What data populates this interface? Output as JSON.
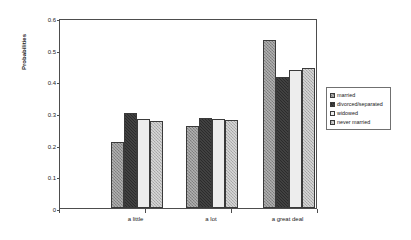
{
  "chart_data": {
    "type": "bar",
    "title": "",
    "subtitle": "",
    "xlabel": "",
    "ylabel": "Probabilities",
    "categories": [
      "a little",
      "a lot",
      "a great deal"
    ],
    "series": [
      {
        "name": "married",
        "values": [
          0.208,
          0.259,
          0.532
        ],
        "color": "#8f8f8f"
      },
      {
        "name": "divorced/separated",
        "values": [
          0.301,
          0.283,
          0.414
        ],
        "color": "#2b2b2b"
      },
      {
        "name": "widowed",
        "values": [
          0.281,
          0.28,
          0.435
        ],
        "color": "#ededed"
      },
      {
        "name": "never married",
        "values": [
          0.276,
          0.278,
          0.441
        ],
        "color": "#b4b4b4"
      }
    ],
    "ylim": [
      0,
      0.6
    ],
    "yticks": [
      "0",
      "0.1",
      "0.2",
      "0.3",
      "0.4",
      "0.5",
      "0.6"
    ],
    "ytick_values": [
      0,
      0.1,
      0.2,
      0.3,
      0.4,
      0.5,
      0.6
    ],
    "grid": false,
    "legend_position": "right",
    "legend_entries": [
      "married",
      "divorced/separated",
      "widowed",
      "never married"
    ],
    "frame": true
  }
}
